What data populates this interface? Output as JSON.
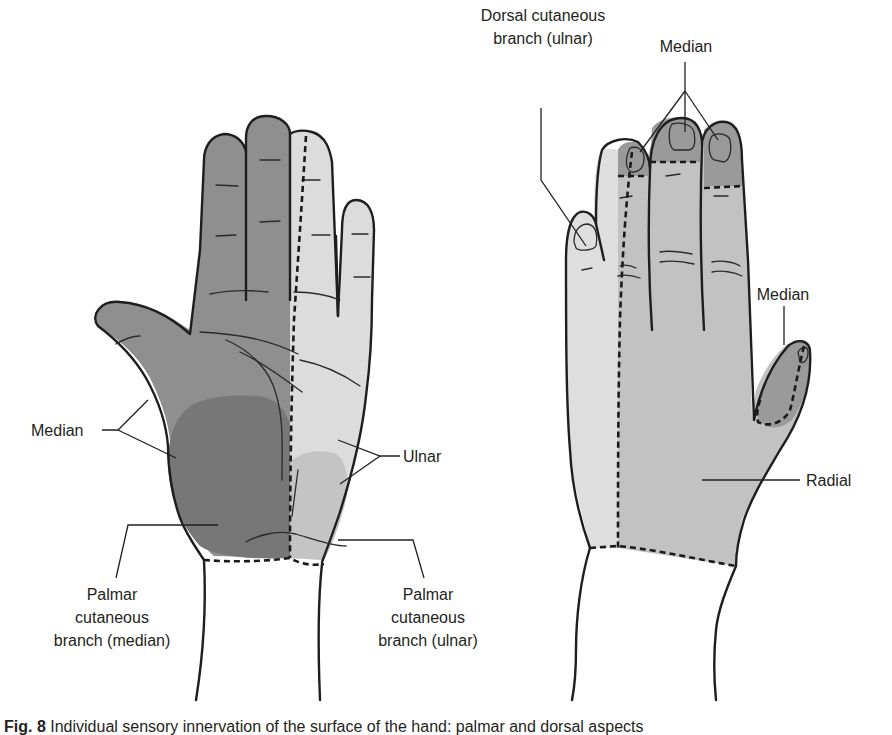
{
  "figure": {
    "caption_prefix": "Fig. 8",
    "caption_text": "Individual sensory innervation of the surface of the hand: palmar and dorsal aspects"
  },
  "palmar_view": {
    "labels": {
      "median": "Median",
      "ulnar": "Ulnar",
      "palmar_median_line1": "Palmar",
      "palmar_median_line2": "cutaneous",
      "palmar_median_line3": "branch (median)",
      "palmar_ulnar_line1": "Palmar",
      "palmar_ulnar_line2": "cutaneous",
      "palmar_ulnar_line3": "branch (ulnar)"
    }
  },
  "dorsal_view": {
    "labels": {
      "dorsal_cutaneous_line1": "Dorsal cutaneous",
      "dorsal_cutaneous_line2": "branch (ulnar)",
      "median_fingertips": "Median",
      "median_thumb": "Median",
      "radial": "Radial"
    }
  },
  "colors": {
    "median_zone": "#8f8f8f",
    "palmar_median_branch": "#777777",
    "ulnar_zone": "#dcdcdc",
    "palmar_ulnar_branch": "#c4c4c4",
    "radial_zone": "#c2c2c2",
    "dorsal_ulnar_zone": "#dedede",
    "dorsal_median_tips": "#9a9a9a",
    "outline": "#1e1e1e"
  }
}
